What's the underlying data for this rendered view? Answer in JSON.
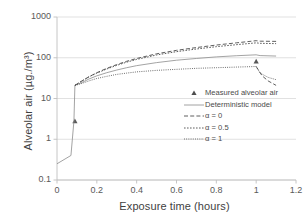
{
  "chart_data": {
    "type": "line",
    "title": "",
    "xlabel": "Exposure time (hours)",
    "ylabel": "Alveolar air (µg./m³)",
    "xlim": [
      0,
      1.2
    ],
    "ylim": [
      0.1,
      1000
    ],
    "yscale": "log",
    "xticks": [
      "0",
      "0.2",
      "0.4",
      "0.6",
      "0.8",
      "1",
      "1.2"
    ],
    "xtick_values": [
      0,
      0.2,
      0.4,
      0.6,
      0.8,
      1,
      1.2
    ],
    "yticks": [
      "0.1",
      "1",
      "10",
      "100",
      "1000"
    ],
    "ytick_values": [
      0.1,
      1,
      10,
      100,
      1000
    ],
    "grid": "horizontal",
    "legend_position": "lower-right-inside",
    "series": [
      {
        "name": "Measured alveolar air",
        "style": "marker",
        "marker": "triangle",
        "color": "#595959",
        "points": [
          {
            "x": 0.09,
            "y": 2.8
          },
          {
            "x": 1.0,
            "y": 82
          }
        ]
      },
      {
        "name": "Deterministic model",
        "style": "solid",
        "color": "#8c8c8c",
        "points": [
          {
            "x": 0.0,
            "y": 0.25
          },
          {
            "x": 0.07,
            "y": 0.4
          },
          {
            "x": 0.085,
            "y": 2.8
          },
          {
            "x": 0.09,
            "y": 21
          },
          {
            "x": 0.12,
            "y": 24
          },
          {
            "x": 0.16,
            "y": 30
          },
          {
            "x": 0.2,
            "y": 36
          },
          {
            "x": 0.25,
            "y": 43
          },
          {
            "x": 0.3,
            "y": 50
          },
          {
            "x": 0.35,
            "y": 57
          },
          {
            "x": 0.4,
            "y": 64
          },
          {
            "x": 0.5,
            "y": 76
          },
          {
            "x": 0.6,
            "y": 87
          },
          {
            "x": 0.7,
            "y": 96
          },
          {
            "x": 0.8,
            "y": 105
          },
          {
            "x": 0.9,
            "y": 112
          },
          {
            "x": 1.0,
            "y": 118
          },
          {
            "x": 1.02,
            "y": 113
          },
          {
            "x": 1.1,
            "y": 110
          }
        ]
      },
      {
        "name": "α = 0",
        "style": "dashed",
        "color": "#4d4d4d",
        "points": [
          {
            "x": 0.09,
            "y": 21
          },
          {
            "x": 0.12,
            "y": 26
          },
          {
            "x": 0.16,
            "y": 34
          },
          {
            "x": 0.2,
            "y": 43
          },
          {
            "x": 0.25,
            "y": 55
          },
          {
            "x": 0.3,
            "y": 68
          },
          {
            "x": 0.35,
            "y": 82
          },
          {
            "x": 0.4,
            "y": 96
          },
          {
            "x": 0.5,
            "y": 125
          },
          {
            "x": 0.6,
            "y": 152
          },
          {
            "x": 0.7,
            "y": 178
          },
          {
            "x": 0.8,
            "y": 205
          },
          {
            "x": 0.9,
            "y": 232
          },
          {
            "x": 1.0,
            "y": 262
          },
          {
            "x": 1.02,
            "y": 255
          },
          {
            "x": 1.1,
            "y": 252
          }
        ]
      },
      {
        "name": "α = 0.5",
        "style": "dotted",
        "color": "#4d4d4d",
        "points": [
          {
            "x": 0.09,
            "y": 21
          },
          {
            "x": 0.12,
            "y": 26
          },
          {
            "x": 0.16,
            "y": 34
          },
          {
            "x": 0.2,
            "y": 42
          },
          {
            "x": 0.25,
            "y": 53
          },
          {
            "x": 0.3,
            "y": 65
          },
          {
            "x": 0.35,
            "y": 78
          },
          {
            "x": 0.4,
            "y": 91
          },
          {
            "x": 0.5,
            "y": 117
          },
          {
            "x": 0.6,
            "y": 141
          },
          {
            "x": 0.7,
            "y": 164
          },
          {
            "x": 0.8,
            "y": 187
          },
          {
            "x": 0.9,
            "y": 209
          },
          {
            "x": 1.0,
            "y": 232
          },
          {
            "x": 1.02,
            "y": 226
          },
          {
            "x": 1.1,
            "y": 222
          }
        ]
      },
      {
        "name": "α = 1",
        "style": "fine-dotted",
        "color": "#4d4d4d",
        "points": [
          {
            "x": 0.09,
            "y": 21
          },
          {
            "x": 0.12,
            "y": 23
          },
          {
            "x": 0.16,
            "y": 27
          },
          {
            "x": 0.2,
            "y": 31
          },
          {
            "x": 0.25,
            "y": 35
          },
          {
            "x": 0.3,
            "y": 39
          },
          {
            "x": 0.35,
            "y": 42
          },
          {
            "x": 0.4,
            "y": 45
          },
          {
            "x": 0.5,
            "y": 49
          },
          {
            "x": 0.6,
            "y": 52
          },
          {
            "x": 0.7,
            "y": 55
          },
          {
            "x": 0.8,
            "y": 57
          },
          {
            "x": 0.9,
            "y": 59
          },
          {
            "x": 1.0,
            "y": 61
          },
          {
            "x": 1.02,
            "y": 42
          },
          {
            "x": 1.06,
            "y": 33
          },
          {
            "x": 1.1,
            "y": 29
          }
        ]
      },
      {
        "name": "post-exposure-decay-lower",
        "style": "dashed",
        "color": "#4d4d4d",
        "points": [
          {
            "x": 1.0,
            "y": 61
          },
          {
            "x": 1.03,
            "y": 36
          },
          {
            "x": 1.06,
            "y": 27
          },
          {
            "x": 1.1,
            "y": 21
          }
        ]
      }
    ],
    "legend": [
      {
        "label": "Measured alveolar air",
        "key": "triangle"
      },
      {
        "label": "Deterministic model",
        "key": "solid"
      },
      {
        "label": "α = 0",
        "key": "dashed"
      },
      {
        "label": "α = 0.5",
        "key": "dotted"
      },
      {
        "label": "α = 1",
        "key": "fine-dotted"
      }
    ]
  },
  "colors": {
    "grid": "#d9d9d9",
    "axis": "#bfbfbf",
    "text": "#4d4d4d",
    "curve_dark": "#4d4d4d",
    "curve_light": "#8c8c8c"
  }
}
